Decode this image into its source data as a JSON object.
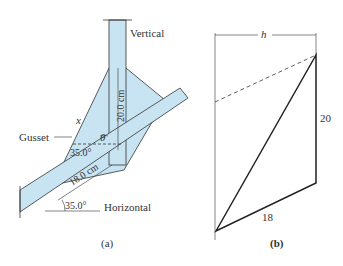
{
  "panel_a": {
    "caption": "(a)",
    "labels": {
      "vertical": "Vertical",
      "horizontal": "Horizontal",
      "gusset": "Gusset",
      "x": "x",
      "theta": "θ",
      "dim_vertical": "20.0 cm",
      "dim_diagonal": "18.0 cm",
      "angle_inner": "35.0°",
      "angle_outer": "35.0°"
    }
  },
  "panel_b": {
    "caption": "(b)",
    "labels": {
      "h": "h",
      "side_vertical": "20",
      "side_bottom": "18"
    }
  },
  "colors": {
    "member_fill": "#c8e4f2",
    "line": "#333333"
  }
}
